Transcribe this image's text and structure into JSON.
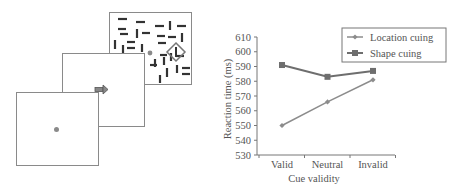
{
  "diagram": {
    "screens": [
      {
        "name": "fixation",
        "content": "fixation-dot"
      },
      {
        "name": "cue",
        "content": "arrow-cue"
      },
      {
        "name": "search",
        "content": "line-segments-with-diamond-target"
      }
    ],
    "colors": {
      "frame": "#8a8a8a",
      "dot": "#8a8a8a",
      "segments": "#333333"
    }
  },
  "chart_data": {
    "type": "line",
    "title": "",
    "xlabel": "Cue validity",
    "ylabel": "Reaction time (ms)",
    "categories": [
      "Valid",
      "Neutral",
      "Invalid"
    ],
    "ylim": [
      530,
      610
    ],
    "yticks": [
      530,
      540,
      550,
      560,
      570,
      580,
      590,
      600,
      610
    ],
    "series": [
      {
        "name": "Location cuing",
        "marker": "diamond",
        "color": "#8c8c8c",
        "values": [
          550,
          566,
          581
        ]
      },
      {
        "name": "Shape cuing",
        "marker": "square",
        "color": "#6e6e6e",
        "values": [
          591,
          583,
          587
        ]
      }
    ],
    "legend": {
      "position": "top-right",
      "box": true
    },
    "grid": false
  }
}
